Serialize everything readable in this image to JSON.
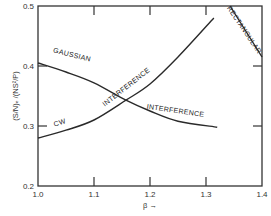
{
  "chart_data": {
    "type": "line",
    "title": "",
    "xlabel": "β →",
    "ylabel": "(S/N)ₑ /(NS²/P)",
    "xlim": [
      1.0,
      1.4
    ],
    "ylim": [
      0.2,
      0.5
    ],
    "xticks": [
      1.0,
      1.1,
      1.2,
      1.3,
      1.4
    ],
    "xtick_labels": [
      "1.0",
      "1.1",
      "1.2",
      "1.3",
      "1.4"
    ],
    "yticks": [
      0.2,
      0.3,
      0.4,
      0.5
    ],
    "ytick_labels": [
      "0.2",
      "0.3",
      "0.4",
      "0.5"
    ],
    "grid": false,
    "legend": "none (inline curve labels)",
    "series": [
      {
        "name": "Gaussian interference",
        "x": [
          1.0,
          1.05,
          1.1,
          1.157,
          1.2,
          1.25,
          1.32
        ],
        "y": [
          0.405,
          0.39,
          0.372,
          0.343,
          0.325,
          0.308,
          0.298
        ]
      },
      {
        "name": "CW interference",
        "x": [
          1.0,
          1.05,
          1.1,
          1.157,
          1.2,
          1.25,
          1.314
        ],
        "y": [
          0.28,
          0.293,
          0.31,
          0.343,
          0.37,
          0.415,
          0.48
        ]
      },
      {
        "name": "Rectangular",
        "x": [
          1.343,
          1.4
        ],
        "y": [
          0.5,
          0.415
        ]
      }
    ],
    "annotations": [
      {
        "text": "GAUSSIAN",
        "x": 1.06,
        "y": 0.415,
        "angle": 14
      },
      {
        "text": "INTERFERENCE",
        "x": 1.245,
        "y": 0.322,
        "angle": 8
      },
      {
        "text": "CW",
        "x": 1.04,
        "y": 0.302,
        "angle": -18
      },
      {
        "text": "INTERFERENCE",
        "x": 1.16,
        "y": 0.362,
        "angle": -38
      },
      {
        "text": "RECTANGULAR",
        "x": 1.365,
        "y": 0.458,
        "angle": 56
      }
    ]
  }
}
